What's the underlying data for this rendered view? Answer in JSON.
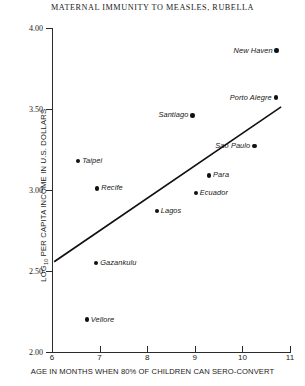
{
  "chart_data": {
    "type": "scatter",
    "title": "MATERNAL IMMUNITY TO MEASLES, RUBELLA",
    "xlabel": "AGE IN MONTHS WHEN 80% OF CHILDREN CAN SERO-CONVERT",
    "ylabel": "LOG10 PER CAPITA INCOME IN U.S. DOLLARS",
    "ylabel_base": "LOG",
    "ylabel_sub": "10",
    "ylabel_rest": " PER CAPITA INCOME IN U.S. DOLLARS",
    "xlim": [
      6,
      11
    ],
    "ylim": [
      2.0,
      4.0
    ],
    "xticks": [
      6,
      7,
      8,
      9,
      10,
      11
    ],
    "xtick_labels": [
      "6",
      "7",
      "8",
      "9",
      "10",
      "11"
    ],
    "yticks": [
      2.0,
      2.5,
      3.0,
      3.5,
      4.0
    ],
    "ytick_labels": [
      "2.00",
      "2.50",
      "3.00",
      "3.50",
      "4.00"
    ],
    "grid": false,
    "legend": "none",
    "marker_color": "#111111",
    "line_color": "#111111",
    "points": [
      {
        "label": "New Haven",
        "x": 10.72,
        "y": 3.86,
        "label_side": "left"
      },
      {
        "label": "Porto Alegre",
        "x": 10.7,
        "y": 3.57,
        "label_side": "left"
      },
      {
        "label": "Santiago",
        "x": 8.95,
        "y": 3.46,
        "label_side": "left"
      },
      {
        "label": "Sao Paulo",
        "x": 10.25,
        "y": 3.27,
        "label_side": "left"
      },
      {
        "label": "Taipei",
        "x": 6.55,
        "y": 3.18,
        "label_side": "right"
      },
      {
        "label": "Para",
        "x": 9.3,
        "y": 3.09,
        "label_side": "right"
      },
      {
        "label": "Recife",
        "x": 6.95,
        "y": 3.01,
        "label_side": "right"
      },
      {
        "label": "Ecuador",
        "x": 9.02,
        "y": 2.98,
        "label_side": "right"
      },
      {
        "label": "Lagos",
        "x": 8.2,
        "y": 2.87,
        "label_side": "right"
      },
      {
        "label": "Gazankulu",
        "x": 6.93,
        "y": 2.55,
        "label_side": "right"
      },
      {
        "label": "Vellore",
        "x": 6.73,
        "y": 2.2,
        "label_side": "right"
      }
    ],
    "trend_line": {
      "x0": 6.06,
      "y0": 2.56,
      "x1": 10.8,
      "y1": 3.51
    }
  }
}
